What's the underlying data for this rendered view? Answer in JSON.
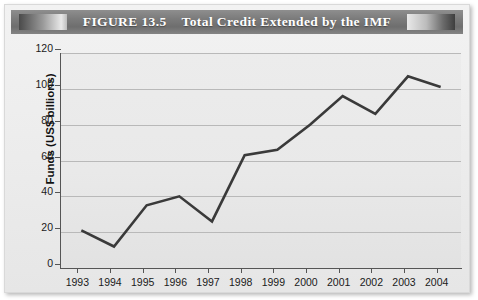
{
  "figure": {
    "title_prefix": "FIGURE 13.5",
    "title_main": "Total Credit Extended by the IMF",
    "title_full": "FIGURE 13.5    Total Credit Extended by the IMF",
    "banner_color": "#7c7c7c",
    "background_color": "#ededed",
    "plot_background_color": "#e9e9e9",
    "line_color": "#3a3a3a",
    "gridline_color": "#b9b9b9",
    "axis_color": "#555555"
  },
  "chart_data": {
    "type": "line",
    "title": "Total Credit Extended by the IMF",
    "xlabel": "",
    "ylabel": "Funds (US$ billions)",
    "categories": [
      "1993",
      "1994",
      "1995",
      "1996",
      "1997",
      "1998",
      "1999",
      "2000",
      "2001",
      "2002",
      "2003",
      "2004"
    ],
    "values": [
      21,
      12,
      35,
      40,
      26,
      63,
      66,
      80,
      96,
      86,
      107,
      101
    ],
    "series": [
      {
        "name": "Total Credit Extended by the IMF",
        "values": [
          21,
          12,
          35,
          40,
          26,
          63,
          66,
          80,
          96,
          86,
          107,
          101
        ]
      }
    ],
    "ylim": [
      0,
      120
    ],
    "yticks": [
      0,
      20,
      40,
      60,
      80,
      100,
      120
    ],
    "ytick_labels": [
      "0",
      "20",
      "40",
      "60",
      "80",
      "100",
      "120"
    ],
    "xtick_labels": [
      "1993",
      "1994",
      "1995",
      "1996",
      "1997",
      "1998",
      "1999",
      "2000",
      "2001",
      "2002",
      "2003",
      "2004"
    ],
    "grid": true,
    "grid_axis": "y",
    "legend": false,
    "legend_position": "none",
    "markers": false,
    "line_width": 2.6
  }
}
